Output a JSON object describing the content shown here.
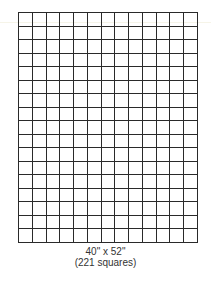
{
  "diagram": {
    "type": "quilt-grid",
    "columns": 13,
    "rows": 17,
    "line_color": "#2a2a2a",
    "background": "#ffffff"
  },
  "caption": {
    "dimensions": "40\" x 52\"",
    "squares": "(221 squares)"
  }
}
